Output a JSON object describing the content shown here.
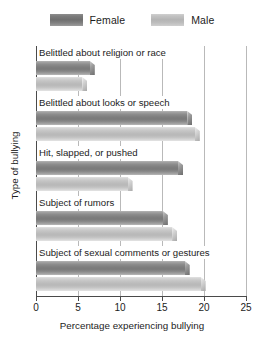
{
  "chart_data": {
    "type": "bar",
    "orientation": "horizontal",
    "title": "",
    "xlabel": "Percentage experiencing bullying",
    "ylabel": "Type of bullying",
    "xlim": [
      0,
      25
    ],
    "xticks": [
      0,
      5,
      10,
      15,
      20,
      25
    ],
    "xtick_labels": [
      "0",
      "5",
      "10",
      "15",
      "20",
      "25"
    ],
    "grid": true,
    "grid_axis": "x",
    "legend_position": "top-center",
    "categories": [
      "Belittled about religion or race",
      "Belittled about looks or speech",
      "Hit, slapped, or pushed",
      "Subject of rumors",
      "Subject of sexual comments or gestures"
    ],
    "series": [
      {
        "name": "Female",
        "color": "#7d7d7d",
        "values": [
          7.0,
          18.6,
          17.5,
          15.7,
          18.3
        ]
      },
      {
        "name": "Male",
        "color": "#bdbdbd",
        "values": [
          6.1,
          19.5,
          11.5,
          16.8,
          20.2
        ]
      }
    ]
  },
  "legend": {
    "items": [
      {
        "label": "Female",
        "swatch": "female"
      },
      {
        "label": "Male",
        "swatch": "male"
      }
    ]
  }
}
